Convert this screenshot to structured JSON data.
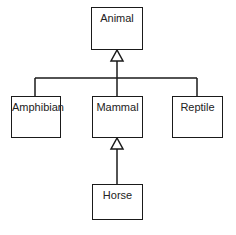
{
  "diagram": {
    "type": "uml-class-inheritance",
    "classes": [
      {
        "id": "animal",
        "name": "Animal"
      },
      {
        "id": "amphibian",
        "name": "Amphibian"
      },
      {
        "id": "mammal",
        "name": "Mammal"
      },
      {
        "id": "reptile",
        "name": "Reptile"
      },
      {
        "id": "horse",
        "name": "Horse"
      }
    ],
    "relations": [
      {
        "from": "amphibian",
        "to": "animal",
        "kind": "generalization"
      },
      {
        "from": "mammal",
        "to": "animal",
        "kind": "generalization"
      },
      {
        "from": "reptile",
        "to": "animal",
        "kind": "generalization"
      },
      {
        "from": "horse",
        "to": "mammal",
        "kind": "generalization"
      }
    ],
    "colors": {
      "stroke": "#1a1a1a",
      "fill": "#ffffff",
      "text": "#222222"
    }
  }
}
